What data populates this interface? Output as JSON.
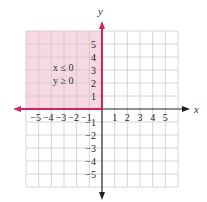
{
  "chart_data": {
    "type": "region",
    "title": "",
    "xlabel": "x",
    "ylabel": "y",
    "xlim": [
      -6,
      6
    ],
    "ylim": [
      -6,
      6
    ],
    "grid": true,
    "x_ticks": [
      -5,
      -4,
      -3,
      -2,
      -1,
      1,
      2,
      3,
      4,
      5
    ],
    "y_ticks": [
      -5,
      -4,
      -3,
      -2,
      -1,
      1,
      2,
      3,
      4,
      5
    ],
    "shaded_region": {
      "description": "second quadrant including boundaries",
      "x_range": [
        -6,
        0
      ],
      "y_range": [
        0,
        6
      ],
      "inequalities": [
        "x ≤ 0",
        "y ≥ 0"
      ]
    },
    "boundary_rays": [
      {
        "name": "negative x-axis",
        "from": [
          0,
          0
        ],
        "to": [
          -6,
          0
        ],
        "color": "#d0245a"
      },
      {
        "name": "positive y-axis",
        "from": [
          0,
          0
        ],
        "to": [
          0,
          6
        ],
        "color": "#d0245a"
      }
    ],
    "annotations": [
      "x ≤ 0",
      "y ≥ 0"
    ]
  },
  "labels": {
    "x_axis": "x",
    "y_axis": "y",
    "ineq1": "x ≤ 0",
    "ineq2": "y ≥ 0"
  },
  "colors": {
    "shade": "#f7d7e1",
    "boundary": "#d0245a",
    "axis": "#222222",
    "grid": "#cccccc"
  }
}
